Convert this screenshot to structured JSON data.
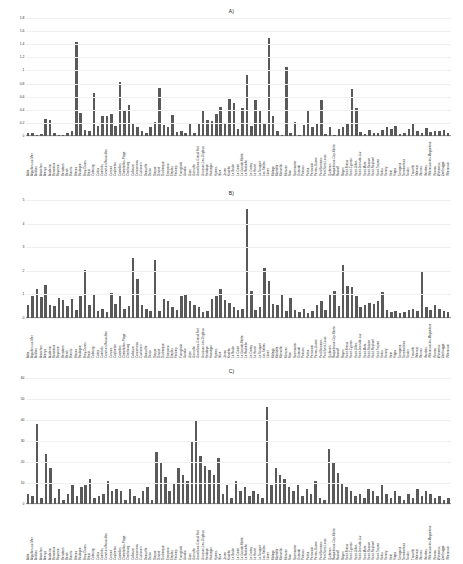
{
  "figure": {
    "background": "#ffffff",
    "bar_color": "#595959",
    "grid_color": "#f0f0f0",
    "axis_color": "#9a9a9a"
  },
  "categories": [
    "Adra",
    "Aiguillon-sur-Mer",
    "Antibes",
    "Arcachon",
    "Arenys",
    "Audierne",
    "Barcelona",
    "Bayonne",
    "Benidorm",
    "Berck",
    "Biarritz",
    "Blanes",
    "Boulogne",
    "Bray-Dunes",
    "Brest",
    "Cabourg",
    "Calais",
    "Cambrils",
    "Canet-en-Roussillon",
    "Cannes",
    "Capbreton",
    "Castellon",
    "Chatelaillon-Plage",
    "Cherbourg",
    "Collioure",
    "Concarneau",
    "Cuxhaven",
    "Deauville",
    "Denia",
    "Dieppe",
    "Dinard",
    "Dunkerque",
    "Estepona",
    "Etaples",
    "Fecamp",
    "Fuengirola",
    "Gandia",
    "Gijon",
    "Granville",
    "Gravelines-Grand-Fort",
    "Gruissan-Les-Onglous",
    "Hendaye",
    "Hossegor",
    "Hyeres",
    "Ibiza",
    "Javea",
    "Knokke",
    "La Baule",
    "La Ciotat",
    "La Grande-Motte",
    "La Rochelle",
    "Le Crotoy",
    "Le Havre",
    "Le Touquet",
    "Les Sables",
    "Lloret",
    "Malaga",
    "Marbella",
    "Marseille",
    "Mimizan",
    "Nice",
    "Noirmoutier",
    "Ostende",
    "Palavas",
    "Palma",
    "Peniscola",
    "Perros-Guirec",
    "Port-Barcares",
    "Port-Saint-Louis",
    "Quiberon",
    "Roquebrune-Cap-Martin",
    "Roscoff",
    "Royan",
    "Saint-Brieuc",
    "Saint-Cyprien",
    "Saint-Gilles",
    "Saint-Jean-de-Luz",
    "Saint-Malo",
    "Saint-Nazaire",
    "Saint-Raphael",
    "Saint-Tropez",
    "Salou",
    "Sanary",
    "Sete",
    "Sitges",
    "Tarragona",
    "Torremolinos",
    "Toulon",
    "Trouville",
    "Valencia",
    "Vannes",
    "Vendres",
    "Villeneuve-les-Maguelone",
    "Vinaros",
    "Wimereux",
    "Zeebrugge",
    "Villeneuve"
  ],
  "panels": [
    {
      "id": "A",
      "title": "A)",
      "ylabel": "MAE (km²)",
      "yticks": [
        0,
        0.2,
        0.4,
        0.6,
        0.8,
        1.0,
        1.2,
        1.4,
        1.6,
        1.8
      ],
      "ytick_labels": [
        "0",
        "0.2",
        "0.4",
        "0.6",
        "0.8",
        "1",
        "1.2",
        "1.4",
        "1.6",
        "1.8"
      ],
      "ymin": 0,
      "ymax": 1.8
    },
    {
      "id": "B",
      "title": "B)",
      "ylabel": "RMSE (km²)",
      "yticks": [
        0,
        1,
        2,
        3,
        4,
        5
      ],
      "ytick_labels": [
        "0",
        "1",
        "2",
        "3",
        "4",
        "5"
      ],
      "ymin": 0,
      "ymax": 5
    },
    {
      "id": "C",
      "title": "C)",
      "ylabel": "MAE (euros/inhabitant)",
      "yticks": [
        0,
        10,
        20,
        30,
        40,
        50,
        60
      ],
      "ytick_labels": [
        "0",
        "10",
        "20",
        "30",
        "40",
        "50",
        "60"
      ],
      "ymin": 0,
      "ymax": 60
    }
  ],
  "chart_data": [
    {
      "type": "bar",
      "panel": "A",
      "title": "A)",
      "xlabel": "",
      "ylabel": "MAE (km²)",
      "ylim": [
        0,
        1.8
      ],
      "grid": true,
      "legend": "none",
      "categories": [
        "Adra",
        "Aiguillon-sur-Mer",
        "Antibes",
        "Arcachon",
        "Arenys",
        "Audierne",
        "Barcelona",
        "Bayonne",
        "Benidorm",
        "Berck",
        "Biarritz",
        "Blanes",
        "Boulogne",
        "Bray-Dunes",
        "Brest",
        "Cabourg",
        "Calais",
        "Cambrils",
        "Canet-en-Roussillon",
        "Cannes",
        "Capbreton",
        "Castellon",
        "Chatelaillon-Plage",
        "Cherbourg",
        "Collioure",
        "Concarneau",
        "Cuxhaven",
        "Deauville",
        "Denia",
        "Dieppe",
        "Dinard",
        "Dunkerque",
        "Estepona",
        "Etaples",
        "Fecamp",
        "Fuengirola",
        "Gandia",
        "Gijon",
        "Granville",
        "Gravelines-Grand-Fort",
        "Gruissan-Les-Onglous",
        "Hendaye",
        "Hossegor",
        "Hyeres",
        "Ibiza",
        "Javea",
        "Knokke",
        "La Baule",
        "La Ciotat",
        "La Grande-Motte",
        "La Rochelle",
        "Le Crotoy",
        "Le Havre",
        "Le Touquet",
        "Les Sables",
        "Lloret",
        "Malaga",
        "Marbella",
        "Marseille",
        "Mimizan",
        "Nice",
        "Noirmoutier",
        "Ostende",
        "Palavas",
        "Palma",
        "Peniscola",
        "Perros-Guirec",
        "Port-Barcares",
        "Port-Saint-Louis",
        "Quiberon",
        "Roquebrune-Cap-Martin",
        "Roscoff",
        "Royan",
        "Saint-Brieuc",
        "Saint-Cyprien",
        "Saint-Gilles",
        "Saint-Jean-de-Luz",
        "Saint-Malo",
        "Saint-Nazaire",
        "Saint-Raphael",
        "Saint-Tropez",
        "Salou",
        "Sanary",
        "Sete",
        "Sitges",
        "Tarragona",
        "Torremolinos",
        "Toulon",
        "Trouville",
        "Valencia",
        "Vannes",
        "Vendres",
        "Villeneuve-les-Maguelone",
        "Vinaros",
        "Wimereux",
        "Zeebrugge",
        "Villeneuve"
      ],
      "values": [
        0.05,
        0.04,
        0.02,
        0.03,
        0.26,
        0.24,
        0.04,
        0.01,
        0.01,
        0.05,
        0.07,
        1.44,
        0.35,
        0.09,
        0.08,
        0.65,
        0.16,
        0.3,
        0.31,
        0.33,
        0.16,
        0.82,
        0.38,
        0.47,
        0.18,
        0.13,
        0.07,
        0.05,
        0.14,
        0.22,
        0.73,
        0.17,
        0.14,
        0.32,
        0.06,
        0.07,
        0.04,
        0.19,
        0.05,
        0.2,
        0.4,
        0.25,
        0.23,
        0.33,
        0.44,
        0.2,
        0.56,
        0.5,
        0.1,
        0.42,
        0.93,
        0.15,
        0.55,
        0.38,
        0.19,
        1.5,
        0.3,
        0.08,
        0.02,
        1.06,
        0.04,
        0.22,
        0.02,
        0.17,
        0.4,
        0.14,
        0.2,
        0.55,
        0.03,
        0.13,
        0.02,
        0.11,
        0.14,
        0.18,
        0.72,
        0.42,
        0.06,
        0.03,
        0.09,
        0.05,
        0.05,
        0.09,
        0.13,
        0.11,
        0.15,
        0.03,
        0.05,
        0.1,
        0.18,
        0.07,
        0.04,
        0.12,
        0.06,
        0.08,
        0.07,
        0.09,
        0.05
      ]
    },
    {
      "type": "bar",
      "panel": "B",
      "title": "B)",
      "xlabel": "",
      "ylabel": "RMSE (km²)",
      "ylim": [
        0,
        5
      ],
      "grid": true,
      "legend": "none",
      "categories": [
        "Adra",
        "Aiguillon-sur-Mer",
        "Antibes",
        "Arcachon",
        "Arenys",
        "Audierne",
        "Barcelona",
        "Bayonne",
        "Benidorm",
        "Berck",
        "Biarritz",
        "Blanes",
        "Boulogne",
        "Bray-Dunes",
        "Brest",
        "Cabourg",
        "Calais",
        "Cambrils",
        "Canet-en-Roussillon",
        "Cannes",
        "Capbreton",
        "Castellon",
        "Chatelaillon-Plage",
        "Cherbourg",
        "Collioure",
        "Concarneau",
        "Cuxhaven",
        "Deauville",
        "Denia",
        "Dieppe",
        "Dinard",
        "Dunkerque",
        "Estepona",
        "Etaples",
        "Fecamp",
        "Fuengirola",
        "Gandia",
        "Gijon",
        "Granville",
        "Gravelines-Grand-Fort",
        "Gruissan-Les-Onglous",
        "Hendaye",
        "Hossegor",
        "Hyeres",
        "Ibiza",
        "Javea",
        "Knokke",
        "La Baule",
        "La Ciotat",
        "La Grande-Motte",
        "La Rochelle",
        "Le Crotoy",
        "Le Havre",
        "Le Touquet",
        "Les Sables",
        "Lloret",
        "Malaga",
        "Marbella",
        "Marseille",
        "Mimizan",
        "Nice",
        "Noirmoutier",
        "Ostende",
        "Palavas",
        "Palma",
        "Peniscola",
        "Perros-Guirec",
        "Port-Barcares",
        "Port-Saint-Louis",
        "Quiberon",
        "Roquebrune-Cap-Martin",
        "Roscoff",
        "Royan",
        "Saint-Brieuc",
        "Saint-Cyprien",
        "Saint-Gilles",
        "Saint-Jean-de-Luz",
        "Saint-Malo",
        "Saint-Nazaire",
        "Saint-Raphael",
        "Saint-Tropez",
        "Salou",
        "Sanary",
        "Sete",
        "Sitges",
        "Tarragona",
        "Torremolinos",
        "Toulon",
        "Trouville",
        "Valencia",
        "Vannes",
        "Vendres",
        "Villeneuve-les-Maguelone",
        "Vinaros",
        "Wimereux",
        "Zeebrugge",
        "Villeneuve"
      ],
      "values": [
        0.55,
        0.95,
        1.25,
        0.9,
        1.4,
        0.55,
        0.5,
        0.85,
        0.75,
        0.5,
        0.8,
        0.35,
        0.95,
        2.05,
        0.55,
        1.0,
        0.3,
        0.4,
        0.25,
        1.05,
        0.6,
        0.95,
        0.4,
        0.5,
        2.55,
        1.65,
        0.55,
        0.4,
        0.3,
        2.45,
        0.3,
        0.8,
        0.7,
        0.45,
        0.35,
        0.95,
        1.0,
        0.7,
        0.55,
        0.45,
        0.25,
        0.3,
        0.8,
        0.95,
        1.25,
        0.75,
        0.65,
        0.45,
        0.35,
        0.4,
        4.6,
        1.15,
        0.35,
        0.45,
        2.1,
        1.55,
        0.6,
        0.55,
        1.0,
        0.3,
        0.85,
        0.35,
        0.25,
        0.4,
        0.2,
        0.3,
        0.55,
        0.7,
        0.35,
        1.0,
        1.15,
        0.5,
        2.25,
        1.35,
        1.3,
        0.95,
        0.45,
        0.55,
        0.65,
        0.6,
        0.7,
        1.1,
        0.35,
        0.25,
        0.3,
        0.2,
        0.25,
        0.35,
        0.4,
        0.3,
        2.0,
        0.45,
        0.35,
        0.55,
        0.4,
        0.3,
        0.25
      ]
    },
    {
      "type": "bar",
      "panel": "C",
      "title": "C)",
      "xlabel": "",
      "ylabel": "MAE (euros/inhabitant)",
      "ylim": [
        0,
        60
      ],
      "grid": true,
      "legend": "none",
      "categories": [
        "Adra",
        "Aiguillon-sur-Mer",
        "Antibes",
        "Arcachon",
        "Arenys",
        "Audierne",
        "Barcelona",
        "Bayonne",
        "Benidorm",
        "Berck",
        "Biarritz",
        "Blanes",
        "Boulogne",
        "Bray-Dunes",
        "Brest",
        "Cabourg",
        "Calais",
        "Cambrils",
        "Canet-en-Roussillon",
        "Cannes",
        "Capbreton",
        "Castellon",
        "Chatelaillon-Plage",
        "Cherbourg",
        "Collioure",
        "Concarneau",
        "Cuxhaven",
        "Deauville",
        "Denia",
        "Dieppe",
        "Dinard",
        "Dunkerque",
        "Estepona",
        "Etaples",
        "Fecamp",
        "Fuengirola",
        "Gandia",
        "Gijon",
        "Granville",
        "Gravelines-Grand-Fort",
        "Gruissan-Les-Onglous",
        "Hendaye",
        "Hossegor",
        "Hyeres",
        "Ibiza",
        "Javea",
        "Knokke",
        "La Baule",
        "La Ciotat",
        "La Grande-Motte",
        "La Rochelle",
        "Le Crotoy",
        "Le Havre",
        "Le Touquet",
        "Les Sables",
        "Lloret",
        "Malaga",
        "Marbella",
        "Marseille",
        "Mimizan",
        "Nice",
        "Noirmoutier",
        "Ostende",
        "Palavas",
        "Palma",
        "Peniscola",
        "Perros-Guirec",
        "Port-Barcares",
        "Port-Saint-Louis",
        "Quiberon",
        "Roquebrune-Cap-Martin",
        "Roscoff",
        "Royan",
        "Saint-Brieuc",
        "Saint-Cyprien",
        "Saint-Gilles",
        "Saint-Jean-de-Luz",
        "Saint-Malo",
        "Saint-Nazaire",
        "Saint-Raphael",
        "Saint-Tropez",
        "Salou",
        "Sanary",
        "Sete",
        "Sitges",
        "Tarragona",
        "Torremolinos",
        "Toulon",
        "Trouville",
        "Valencia",
        "Vannes",
        "Vendres",
        "Villeneuve-les-Maguelone",
        "Vinaros",
        "Wimereux",
        "Zeebrugge",
        "Villeneuve"
      ],
      "values": [
        5,
        4,
        38,
        3,
        24,
        17,
        3,
        7,
        2,
        5,
        9,
        4,
        8,
        9,
        12,
        3,
        4,
        5,
        11,
        6,
        7,
        6,
        2,
        7,
        4,
        3,
        6,
        8,
        2,
        25,
        20,
        13,
        6,
        10,
        17,
        14,
        11,
        30,
        40,
        23,
        18,
        16,
        14,
        22,
        5,
        9,
        3,
        11,
        6,
        8,
        4,
        6,
        5,
        3,
        46,
        9,
        17,
        14,
        12,
        8,
        6,
        9,
        4,
        7,
        5,
        11,
        3,
        2,
        26,
        20,
        15,
        10,
        8,
        6,
        4,
        5,
        3,
        7,
        6,
        4,
        9,
        5,
        3,
        6,
        4,
        2,
        5,
        3,
        7,
        4,
        6,
        5,
        3,
        4,
        2,
        3
      ]
    }
  ]
}
